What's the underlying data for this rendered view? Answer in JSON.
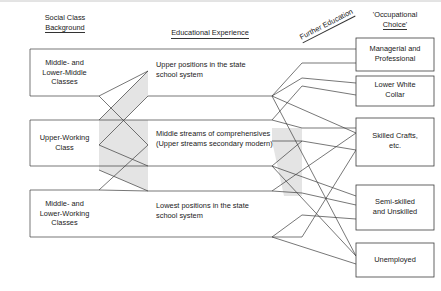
{
  "figure": {
    "colors": {
      "stroke": "#3c3c3c",
      "band_fill": "#e2e2e2",
      "text": "#1a1a1a",
      "frame": "#c8c8c8"
    }
  },
  "headers": [
    {
      "id": "social-class-background",
      "line1": "Social Class",
      "line2": "Background",
      "underlined_line": 2
    },
    {
      "id": "educational-experience",
      "line1": "Educational Experience",
      "line2": "",
      "underlined_line": 1
    },
    {
      "id": "further-education",
      "line1": "Further Education",
      "line2": "",
      "underlined_line": 1,
      "rotated": true
    },
    {
      "id": "occupational-choice",
      "line1": "'Occupational",
      "line2": "Choice'",
      "underlined_line": 2
    }
  ],
  "columns": {
    "left": {
      "name": "Social Class Background",
      "items": [
        {
          "id": "middle-lower-middle-classes",
          "lines": [
            "Middle- and",
            "Lower-Middle",
            "Classes"
          ]
        },
        {
          "id": "upper-working-class",
          "lines": [
            "Upper-Working",
            "Class"
          ],
          "highlighted": true
        },
        {
          "id": "middle-lower-working-classes",
          "lines": [
            "Middle- and",
            "Lower-Working",
            "Classes"
          ]
        }
      ]
    },
    "middle": {
      "name": "Educational Experience",
      "items": [
        {
          "id": "upper-positions-state-school",
          "lines": [
            "Upper positions in the state",
            "school system"
          ]
        },
        {
          "id": "middle-streams-comprehensives",
          "lines": [
            "Middle streams of comprehensives",
            "(Upper streams secondary modern)"
          ],
          "highlighted": true
        },
        {
          "id": "lowest-positions-state-school",
          "lines": [
            "Lowest positions in the state",
            "school system"
          ]
        }
      ]
    },
    "right": {
      "name": "'Occupational Choice'",
      "items": [
        {
          "id": "managerial-and-professional",
          "lines": [
            "Managerial and",
            "Professional"
          ]
        },
        {
          "id": "lower-white-collar",
          "lines": [
            "Lower White",
            "Collar"
          ]
        },
        {
          "id": "skilled-crafts-etc",
          "lines": [
            "Skilled Crafts,",
            "etc."
          ]
        },
        {
          "id": "semi-skilled-and-unskilled",
          "lines": [
            "Semi-skilled",
            "and Unskilled"
          ]
        },
        {
          "id": "unemployed",
          "lines": [
            "Unemployed"
          ]
        }
      ]
    }
  }
}
